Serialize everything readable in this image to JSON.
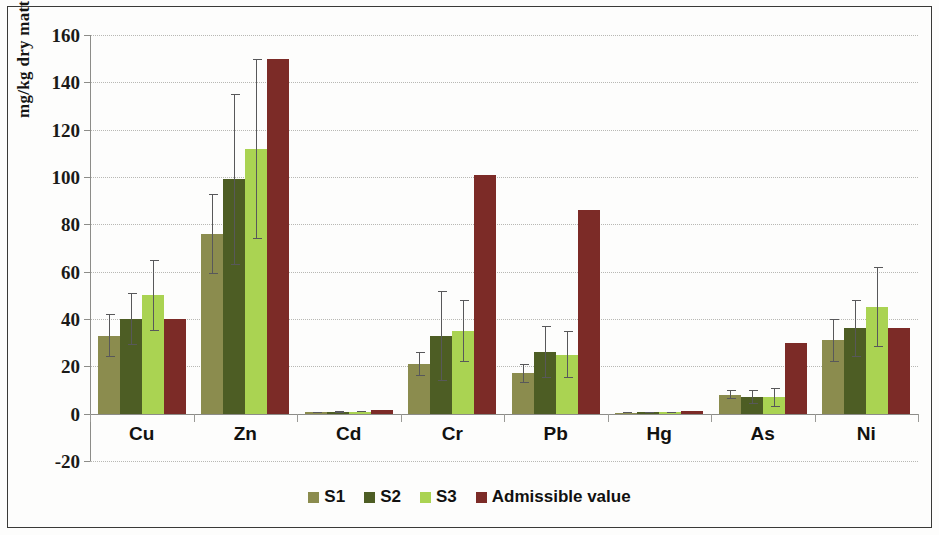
{
  "chart_data": {
    "type": "bar",
    "title": "",
    "xlabel": "",
    "ylabel": "mg/kg dry matter",
    "ylim": [
      -20,
      160
    ],
    "yticks": [
      160,
      140,
      120,
      100,
      80,
      60,
      40,
      20,
      0,
      -20
    ],
    "grid": true,
    "legend_position": "bottom",
    "categories": [
      "Cu",
      "Zn",
      "Cd",
      "Cr",
      "Pb",
      "Hg",
      "As",
      "Ni"
    ],
    "series": [
      {
        "name": "S1",
        "color": "#8b8c4e",
        "values": [
          33,
          76,
          0.6,
          21,
          17,
          0.4,
          8,
          31
        ],
        "errors": [
          9,
          17,
          0.3,
          5,
          4,
          0.2,
          2,
          9
        ]
      },
      {
        "name": "S2",
        "color": "#4d5d24",
        "values": [
          40,
          99,
          0.8,
          33,
          26,
          0.5,
          7,
          36
        ],
        "errors": [
          11,
          36,
          0.4,
          19,
          11,
          0.2,
          3,
          12
        ]
      },
      {
        "name": "S3",
        "color": "#aad352",
        "values": [
          50,
          112,
          0.9,
          35,
          25,
          0.5,
          7,
          45
        ],
        "errors": [
          15,
          38,
          0.4,
          13,
          10,
          0.2,
          4,
          17
        ]
      },
      {
        "name": "Admissible value",
        "color": "#7c2b27",
        "values": [
          40,
          150,
          1.5,
          101,
          86,
          1.0,
          30,
          36
        ],
        "errors": [
          0,
          0,
          0,
          0,
          0,
          0,
          0,
          0
        ]
      }
    ]
  },
  "axis": {
    "y_title": "mg/kg dry matter",
    "y_labels": [
      "160",
      "140",
      "120",
      "100",
      "80",
      "60",
      "40",
      "20",
      "0",
      "-20"
    ],
    "x_labels": [
      "Cu",
      "Zn",
      "Cd",
      "Cr",
      "Pb",
      "Hg",
      "As",
      "Ni"
    ]
  },
  "legend": {
    "items": [
      {
        "label": "S1",
        "color": "#8b8c4e"
      },
      {
        "label": "S2",
        "color": "#4d5d24"
      },
      {
        "label": "S3",
        "color": "#aad352"
      },
      {
        "label": "Admissible value",
        "color": "#7c2b27"
      }
    ]
  }
}
